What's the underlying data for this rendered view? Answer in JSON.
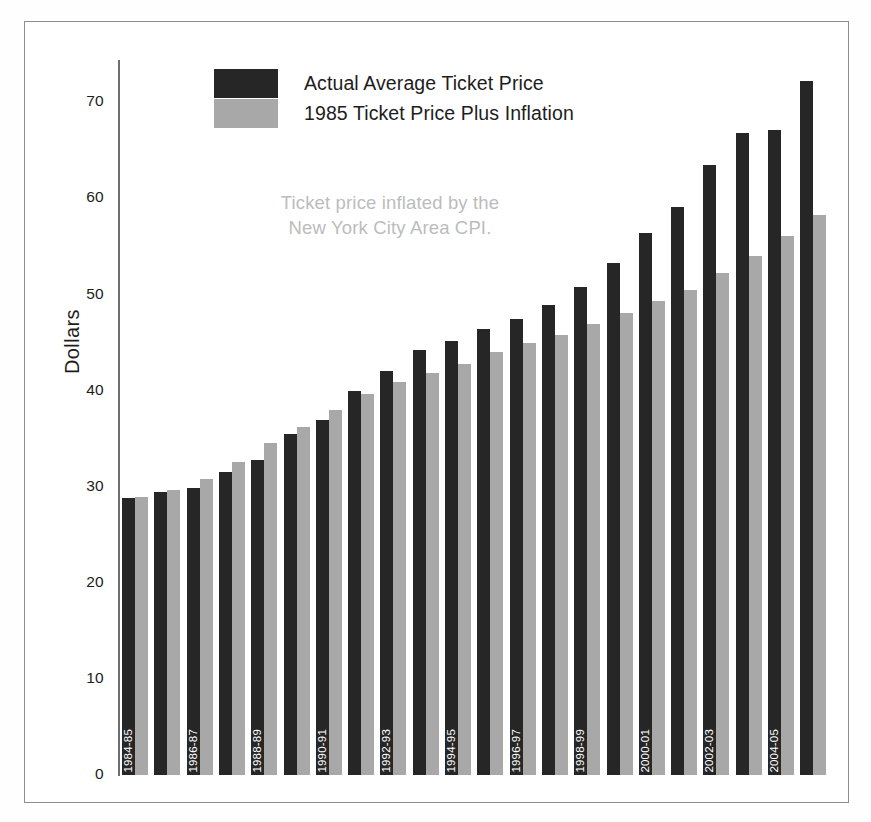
{
  "figure": {
    "y_axis_title": "Dollars",
    "annotation_line1": "Ticket price inflated by the",
    "annotation_line2": "New York City Area CPI.",
    "colors": {
      "actual": "#262626",
      "inflation": "#a8a8a8",
      "axis": "#6e6e6e",
      "frame": "#8d8d8d",
      "annotation_text": "#bcbcbc",
      "label_text": "#1d1d1d",
      "bar_label_text": "#ffffff",
      "background": "#ffffff"
    }
  },
  "legend": {
    "position": "top-center",
    "items": [
      {
        "label": "Actual Average Ticket Price",
        "color": "#262626",
        "key": "actual"
      },
      {
        "label": "1985 Ticket Price Plus Inflation",
        "color": "#a8a8a8",
        "key": "inflation"
      }
    ]
  },
  "chart_data": {
    "type": "bar",
    "title": "",
    "subtitle": "",
    "xlabel": "",
    "ylabel": "Dollars",
    "ylim": [
      0,
      75
    ],
    "yticks": [
      0,
      10,
      20,
      30,
      40,
      50,
      60,
      70
    ],
    "ytick_labels": [
      "0",
      "10",
      "20",
      "30",
      "40",
      "50",
      "60",
      "70"
    ],
    "grid": false,
    "legend_position": "top-center",
    "annotations": [
      "Ticket price inflated by the",
      "New York City Area CPI."
    ],
    "categories": [
      "1984-85",
      "1985-86",
      "1986-87",
      "1987-88",
      "1988-89",
      "1989-90",
      "1990-91",
      "1991-92",
      "1992-93",
      "1993-94",
      "1994-95",
      "1995-96",
      "1996-97",
      "1997-98",
      "1998-99",
      "1999-00",
      "2000-01",
      "2001-02",
      "2002-03",
      "2003-04",
      "2004-05"
    ],
    "tick_labels_shown": [
      "1984-85",
      "",
      "1986-87",
      "",
      "1988-89",
      "",
      "1990-91",
      "",
      "1992-93",
      "",
      "1994-95",
      "",
      "1996-97",
      "",
      "1998-99",
      "",
      "2000-01",
      "",
      "2002-03",
      "",
      "2004-05"
    ],
    "series": [
      {
        "name": "Actual Average Ticket Price",
        "color": "#262626",
        "values": [
          28.8,
          29.5,
          29.9,
          31.5,
          32.8,
          35.5,
          36.9,
          40.0,
          42.0,
          44.2,
          45.2,
          46.4,
          47.5,
          48.9,
          50.8,
          53.3,
          56.4,
          59.1,
          63.5,
          66.8,
          67.1
        ]
      },
      {
        "name": "1985 Ticket Price Plus Inflation",
        "color": "#a8a8a8",
        "values": [
          28.9,
          29.7,
          30.8,
          32.6,
          34.5,
          36.2,
          38.0,
          39.6,
          40.9,
          41.8,
          42.8,
          44.0,
          45.0,
          45.8,
          46.9,
          48.1,
          49.3,
          50.5,
          52.2,
          54.0,
          56.1
        ]
      }
    ],
    "extra_bar": {
      "note": "rightmost pair beyond last tick label",
      "actual": 72.2,
      "inflation": 58.3
    }
  }
}
